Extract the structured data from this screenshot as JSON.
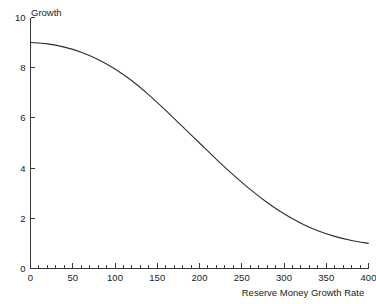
{
  "chart_data": {
    "type": "line",
    "title": "",
    "xlabel": "Reserve Money Growth Rate",
    "ylabel": "Growth",
    "xlim": [
      0,
      400
    ],
    "ylim": [
      0,
      10
    ],
    "grid": false,
    "legend": false,
    "legend_position": "none",
    "x_major_ticks": [
      0,
      50,
      100,
      150,
      200,
      250,
      300,
      350,
      400
    ],
    "x_minor_tick_interval": 10,
    "y_major_ticks": [
      0,
      2,
      4,
      6,
      8,
      10
    ],
    "x_tick_labels": [
      "0",
      "50",
      "100",
      "150",
      "200",
      "250",
      "300",
      "350",
      "400"
    ],
    "y_tick_labels": [
      "0",
      "2",
      "4",
      "6",
      "8",
      "10"
    ],
    "series": [
      {
        "name": "Growth",
        "color": "#2b2b2b",
        "x": [
          0,
          20,
          40,
          60,
          80,
          100,
          120,
          140,
          160,
          180,
          200,
          220,
          240,
          260,
          280,
          300,
          320,
          340,
          360,
          380,
          400
        ],
        "y": [
          9.0,
          8.95,
          8.82,
          8.62,
          8.33,
          7.95,
          7.48,
          6.92,
          6.3,
          5.65,
          5.0,
          4.35,
          3.73,
          3.15,
          2.63,
          2.18,
          1.8,
          1.5,
          1.28,
          1.12,
          1.0
        ]
      }
    ]
  },
  "axis": {
    "y_title": "Growth",
    "x_title": "Reserve Money Growth Rate"
  }
}
